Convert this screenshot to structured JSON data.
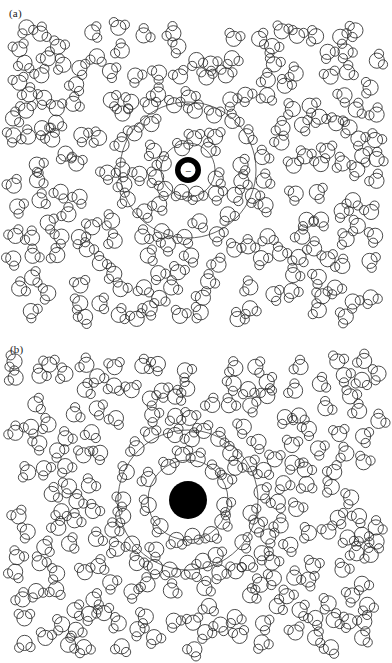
{
  "figure": {
    "width": 392,
    "height": 663,
    "background_color": "#ffffff",
    "stroke_color": "#2b2b2b",
    "ion_color": "#000000"
  },
  "panels": [
    {
      "id": "a",
      "label": "(a)",
      "ion": {
        "name": "small-negative-ion",
        "style": "annulus",
        "sign": "−",
        "center_x": 188,
        "center_y": 170,
        "outer_radius": 13,
        "inner_radius": 7.5,
        "ring_thickness": 5.5,
        "fill": "#000000",
        "inner_fill": "#ffffff"
      },
      "shells": [
        {
          "name": "first-solvation-shell",
          "radius": 27
        },
        {
          "name": "second-solvation-shell",
          "radius": 68
        }
      ],
      "molecule_count": 212,
      "molecule": {
        "oxygen_radius": 7.6,
        "hydrogen_radius": 4.6,
        "bond_angle_deg": 104
      }
    },
    {
      "id": "b",
      "label": "(b)",
      "ion": {
        "name": "large-ion",
        "style": "disk",
        "sign": "",
        "center_x": 188,
        "center_y": 164,
        "outer_radius": 19,
        "inner_radius": 0,
        "ring_thickness": 0,
        "fill": "#000000",
        "inner_fill": "#000000"
      },
      "shells": [
        {
          "name": "first-solvation-shell",
          "radius": 40
        },
        {
          "name": "second-solvation-shell",
          "radius": 70
        }
      ],
      "molecule_count": 212,
      "molecule": {
        "oxygen_radius": 7.6,
        "hydrogen_radius": 4.6,
        "bond_angle_deg": 104
      }
    }
  ],
  "chart_data": {
    "type": "scatter",
    "subtitle": "",
    "xlabel": "",
    "ylabel": "",
    "xlim": [
      0,
      392
    ],
    "ylim": [
      0,
      336
    ],
    "grid": false,
    "legend_position": "none",
    "annotations": [
      "(a)",
      "(b)",
      "−"
    ],
    "series": [
      {
        "name": "panel-a-water-molecules",
        "marker": "water-molecule",
        "count": 212,
        "note": "Oxygen circle r=7.6 px with two hydrogen circles r=4.6 px at 104 deg; density depleted inside first shell, enhanced in shells."
      },
      {
        "name": "panel-a-solvation-shells",
        "marker": "circle-outline",
        "values": [
          27,
          68
        ],
        "note": "Concentric shell radii in px around ion at (188,170)."
      },
      {
        "name": "panel-a-ion",
        "marker": "annulus",
        "values": [
          [
            188,
            170,
            13
          ]
        ],
        "note": "Small negative ion drawn as thick black ring with minus sign."
      },
      {
        "name": "panel-b-water-molecules",
        "marker": "water-molecule",
        "count": 212,
        "note": "Same molecule geometry; shells packed around large ion."
      },
      {
        "name": "panel-b-solvation-shells",
        "marker": "circle-outline",
        "values": [
          40,
          70
        ],
        "note": "Concentric shell radii in px around ion at (188,500) in full-figure coordinates."
      },
      {
        "name": "panel-b-ion",
        "marker": "filled-disk",
        "values": [
          [
            188,
            500,
            19
          ]
        ],
        "note": "Large ion drawn as solid black disk."
      }
    ]
  }
}
